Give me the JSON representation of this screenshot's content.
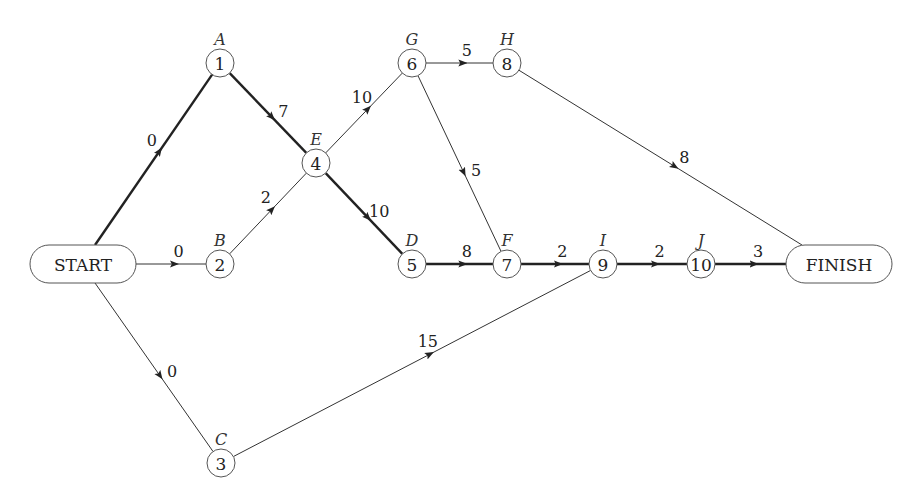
{
  "diagram": {
    "type": "activity-on-node network (critical path)",
    "terminals": {
      "start": {
        "label": "START",
        "x": 83,
        "y": 264
      },
      "finish": {
        "label": "FINISH",
        "x": 839,
        "y": 264
      }
    },
    "nodes": [
      {
        "id": "1",
        "num": "1",
        "activity": "A",
        "x": 220,
        "y": 63
      },
      {
        "id": "2",
        "num": "2",
        "activity": "B",
        "x": 220,
        "y": 264
      },
      {
        "id": "3",
        "num": "3",
        "activity": "C",
        "x": 221,
        "y": 463
      },
      {
        "id": "4",
        "num": "4",
        "activity": "E",
        "x": 316,
        "y": 163
      },
      {
        "id": "5",
        "num": "5",
        "activity": "D",
        "x": 412,
        "y": 264
      },
      {
        "id": "6",
        "num": "6",
        "activity": "G",
        "x": 412,
        "y": 63
      },
      {
        "id": "7",
        "num": "7",
        "activity": "F",
        "x": 507,
        "y": 264
      },
      {
        "id": "8",
        "num": "8",
        "activity": "H",
        "x": 507,
        "y": 63
      },
      {
        "id": "9",
        "num": "9",
        "activity": "I",
        "x": 603,
        "y": 264
      },
      {
        "id": "10",
        "num": "10",
        "activity": "J",
        "x": 701,
        "y": 264
      }
    ],
    "edges": [
      {
        "from": "start",
        "to": "1",
        "weight": "0",
        "critical": true
      },
      {
        "from": "start",
        "to": "2",
        "weight": "0",
        "critical": false
      },
      {
        "from": "start",
        "to": "3",
        "weight": "0",
        "critical": false
      },
      {
        "from": "1",
        "to": "4",
        "weight": "7",
        "critical": true
      },
      {
        "from": "2",
        "to": "4",
        "weight": "2",
        "critical": false
      },
      {
        "from": "4",
        "to": "6",
        "weight": "10",
        "critical": false
      },
      {
        "from": "4",
        "to": "5",
        "weight": "10",
        "critical": true
      },
      {
        "from": "6",
        "to": "8",
        "weight": "5",
        "critical": false
      },
      {
        "from": "6",
        "to": "7",
        "weight": "5",
        "critical": false
      },
      {
        "from": "8",
        "to": "finish",
        "weight": "8",
        "critical": false
      },
      {
        "from": "5",
        "to": "7",
        "weight": "8",
        "critical": true
      },
      {
        "from": "7",
        "to": "9",
        "weight": "2",
        "critical": true
      },
      {
        "from": "3",
        "to": "9",
        "weight": "15",
        "critical": false
      },
      {
        "from": "9",
        "to": "10",
        "weight": "2",
        "critical": true
      },
      {
        "from": "10",
        "to": "finish",
        "weight": "3",
        "critical": true
      }
    ],
    "colors": {
      "line": "#333333",
      "node_stroke": "#555555",
      "background": "#ffffff"
    }
  }
}
